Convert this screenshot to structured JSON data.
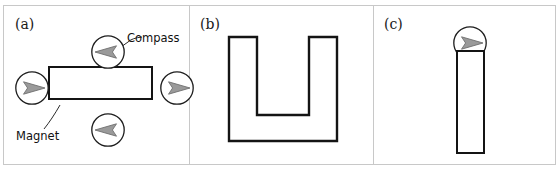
{
  "figure": {
    "width": 560,
    "height": 170,
    "background_color": "#ffffff",
    "frame_color": "#c8c8c8",
    "stroke_color": "#141414",
    "compass_needle_color": "#9a9a9a",
    "compass_needle_outline": "#6f6f6f"
  },
  "panels": [
    {
      "id": "a",
      "label": "(a)",
      "object": {
        "name": "bar-magnet-horizontal",
        "shape": "rectangle",
        "orientation": "horizontal"
      },
      "annotations": [
        {
          "name": "compass-label",
          "text": "Compass"
        },
        {
          "name": "magnet-label",
          "text": "Magnet"
        }
      ],
      "compasses": [
        {
          "name": "compass-above-magnet",
          "position": "top",
          "needle_direction": "left",
          "angle_deg": 180
        },
        {
          "name": "compass-left-of-magnet",
          "position": "left",
          "needle_direction": "right",
          "angle_deg": 0
        },
        {
          "name": "compass-right-of-magnet",
          "position": "right",
          "needle_direction": "right",
          "angle_deg": 0
        },
        {
          "name": "compass-below-magnet",
          "position": "bottom",
          "needle_direction": "left",
          "angle_deg": 180
        }
      ]
    },
    {
      "id": "b",
      "label": "(b)",
      "object": {
        "name": "horseshoe-magnet",
        "shape": "u-shape",
        "orientation": "opening-upward"
      },
      "annotations": [],
      "compasses": [
        {
          "name": "compass-between-poles",
          "position": "top-center",
          "needle_direction": "right",
          "angle_deg": 0
        }
      ]
    },
    {
      "id": "c",
      "label": "(c)",
      "object": {
        "name": "bar-magnet-vertical",
        "shape": "rectangle",
        "orientation": "vertical"
      },
      "annotations": [],
      "compasses": [
        {
          "name": "compass-above-magnet",
          "position": "top",
          "needle_direction": "up",
          "angle_deg": 270
        }
      ]
    }
  ]
}
